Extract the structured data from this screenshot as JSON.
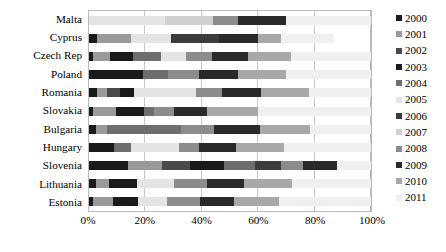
{
  "chart_data": {
    "type": "bar",
    "orientation": "horizontal",
    "stacked": true,
    "normalized": true,
    "title": "",
    "subtitle": "",
    "xlabel": "",
    "ylabel": "",
    "xlim": [
      0,
      100
    ],
    "xticks": [
      0,
      20,
      40,
      60,
      80,
      100
    ],
    "xtick_labels": [
      "0%",
      "20%",
      "40%",
      "60%",
      "80%",
      "100%"
    ],
    "grid": true,
    "grid_axis": "x",
    "legend_position": "right",
    "categories": [
      "Malta",
      "Cyprus",
      "Czech Rep",
      "Poland",
      "Romania",
      "Slovakia",
      "Bulgaria",
      "Hungary",
      "Slovenia",
      "Lithuania",
      "Estonia"
    ],
    "series": [
      {
        "name": "2000",
        "color": "#1a1a1a",
        "values": [
          0.0,
          3.0,
          1.5,
          12.0,
          3.0,
          1.5,
          2.5,
          0.0,
          14.0,
          2.5,
          1.5
        ]
      },
      {
        "name": "2001",
        "color": "#9a9a9a",
        "values": [
          0.0,
          12.0,
          6.0,
          0.0,
          3.5,
          8.0,
          4.0,
          0.0,
          12.0,
          4.5,
          7.0
        ]
      },
      {
        "name": "2002",
        "color": "#4a4a4a",
        "values": [
          0.0,
          0.0,
          0.0,
          0.0,
          4.5,
          0.0,
          0.0,
          0.0,
          10.0,
          0.0,
          0.0
        ]
      },
      {
        "name": "2003",
        "color": "#1a1a1a",
        "values": [
          0.0,
          0.0,
          8.0,
          7.0,
          5.0,
          10.0,
          0.0,
          9.0,
          12.0,
          10.0,
          9.0
        ]
      },
      {
        "name": "2004",
        "color": "#6e6e6e",
        "values": [
          0.0,
          0.0,
          10.0,
          9.0,
          0.0,
          3.5,
          26.0,
          6.0,
          11.0,
          0.0,
          0.0
        ]
      },
      {
        "name": "2005",
        "color": "#e4e4e4",
        "values": [
          27.0,
          14.0,
          9.0,
          0.0,
          22.0,
          0.0,
          0.0,
          17.0,
          0.0,
          13.0,
          10.0
        ]
      },
      {
        "name": "2006",
        "color": "#3c3c3c",
        "values": [
          0.0,
          17.0,
          0.0,
          0.0,
          0.0,
          0.0,
          0.0,
          0.0,
          9.0,
          0.0,
          0.0
        ]
      },
      {
        "name": "2007",
        "color": "#d0d0d0",
        "values": [
          17.0,
          0.0,
          0.0,
          0.0,
          0.0,
          0.0,
          0.0,
          0.0,
          0.0,
          0.0,
          0.0
        ]
      },
      {
        "name": "2008",
        "color": "#8c8c8c",
        "values": [
          9.0,
          0.0,
          9.0,
          11.0,
          9.0,
          7.0,
          12.0,
          7.0,
          8.0,
          12.0,
          12.0
        ]
      },
      {
        "name": "2009",
        "color": "#2a2a2a",
        "values": [
          17.0,
          14.0,
          13.0,
          14.0,
          14.0,
          12.0,
          16.0,
          13.0,
          12.0,
          13.0,
          12.0
        ]
      },
      {
        "name": "2010",
        "color": "#a8a8a8",
        "values": [
          0.0,
          8.0,
          15.0,
          17.0,
          17.0,
          18.0,
          18.0,
          17.0,
          0.0,
          17.0,
          16.0
        ]
      },
      {
        "name": "2011",
        "color": "#f0f0f0",
        "values": [
          30.0,
          19.0,
          28.5,
          30.0,
          22.0,
          40.0,
          21.5,
          31.0,
          12.0,
          28.0,
          32.5
        ]
      }
    ]
  },
  "axis": {
    "x_tick_labels": [
      "0%",
      "20%",
      "40%",
      "60%",
      "80%",
      "100%"
    ],
    "category_labels": [
      "Malta",
      "Cyprus",
      "Czech Rep",
      "Poland",
      "Romania",
      "Slovakia",
      "Bulgaria",
      "Hungary",
      "Slovenia",
      "Lithuania",
      "Estonia"
    ]
  },
  "legend": {
    "entries": [
      {
        "label": "2000",
        "color": "#1a1a1a"
      },
      {
        "label": "2001",
        "color": "#9a9a9a"
      },
      {
        "label": "2002",
        "color": "#4a4a4a"
      },
      {
        "label": "2003",
        "color": "#1a1a1a"
      },
      {
        "label": "2004",
        "color": "#6e6e6e"
      },
      {
        "label": "2005",
        "color": "#e4e4e4"
      },
      {
        "label": "2006",
        "color": "#3c3c3c"
      },
      {
        "label": "2007",
        "color": "#d0d0d0"
      },
      {
        "label": "2008",
        "color": "#8c8c8c"
      },
      {
        "label": "2009",
        "color": "#2a2a2a"
      },
      {
        "label": "2010",
        "color": "#a8a8a8"
      },
      {
        "label": "2011",
        "color": "#f0f0f0"
      }
    ]
  },
  "style": {
    "plot_border_color": "#b9b9b9",
    "gridline_color": "#c8c8c8",
    "background": "#ffffff",
    "text_color": "#000000"
  }
}
